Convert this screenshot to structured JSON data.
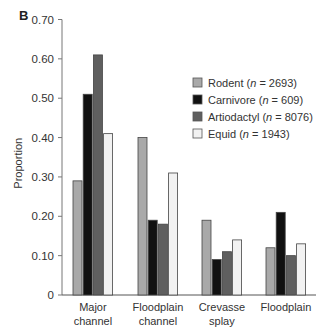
{
  "panel_label": "B",
  "chart_data": {
    "type": "bar",
    "title": "",
    "xlabel": "",
    "ylabel": "Proportion",
    "ylim": [
      0,
      0.7
    ],
    "yticks": [
      "0",
      "0.10",
      "0.20",
      "0.30",
      "0.40",
      "0.50",
      "0.60",
      "0.70"
    ],
    "grid": false,
    "legend_position": "upper right",
    "categories": [
      [
        "Major",
        "channel"
      ],
      [
        "Floodplain",
        "channel"
      ],
      [
        "Crevasse",
        "splay"
      ],
      [
        "Floodplain"
      ]
    ],
    "series": [
      {
        "name": "Rodent",
        "n": "2693",
        "color": "#a9a9a9",
        "values": [
          0.29,
          0.4,
          0.19,
          0.12
        ]
      },
      {
        "name": "Carnivore",
        "n": "609",
        "color": "#111111",
        "values": [
          0.51,
          0.19,
          0.09,
          0.21
        ]
      },
      {
        "name": "Artiodactyl",
        "n": "8076",
        "color": "#5f5f5f",
        "values": [
          0.61,
          0.18,
          0.11,
          0.1
        ]
      },
      {
        "name": "Equid",
        "n": "1943",
        "color": "#f2f2f2",
        "values": [
          0.41,
          0.31,
          0.14,
          0.13
        ]
      }
    ]
  }
}
